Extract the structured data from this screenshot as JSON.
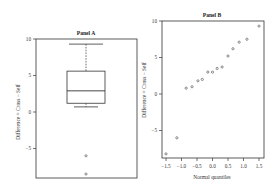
{
  "chart_data": [
    {
      "panel": "A",
      "type": "box",
      "title": "Panel A",
      "xlabel": "",
      "ylabel": "Difference = Cross − Self",
      "ylim": [
        -9.2,
        10
      ],
      "yticks": [
        10,
        5,
        0,
        -5
      ],
      "ytick_labels": [
        "10",
        "5",
        "0",
        "−5"
      ],
      "grid": false,
      "box": {
        "whisker_high": 9.3,
        "q3": 5.6,
        "median": 2.9,
        "q1": 1.2,
        "whisker_low": 0.7
      },
      "outliers": [
        -6.0,
        -8.5
      ]
    },
    {
      "panel": "B",
      "type": "scatter",
      "title": "Panel B",
      "xlabel": "Normal quantiles",
      "ylabel": "Difference = Cross − Self",
      "xlim": [
        -1.65,
        1.65
      ],
      "ylim": [
        -8.8,
        10
      ],
      "xticks": [
        -1.5,
        -1.0,
        -0.5,
        0.0,
        0.5,
        1.0,
        1.5
      ],
      "xtick_labels": [
        "−1.5",
        "−1.0",
        "−0.5",
        "0.0",
        "0.5",
        "1.0",
        "1.5"
      ],
      "yticks": [
        10,
        5,
        0,
        -5
      ],
      "ytick_labels": [
        "10",
        "5",
        "0",
        "−5"
      ],
      "grid": false,
      "points": [
        {
          "x": -1.5,
          "y": -8.2
        },
        {
          "x": -1.15,
          "y": -6.0
        },
        {
          "x": -0.85,
          "y": 0.8
        },
        {
          "x": -0.66,
          "y": 1.0
        },
        {
          "x": -0.47,
          "y": 1.8
        },
        {
          "x": -0.33,
          "y": 2.0
        },
        {
          "x": -0.15,
          "y": 3.0
        },
        {
          "x": 0.0,
          "y": 3.0
        },
        {
          "x": 0.15,
          "y": 3.5
        },
        {
          "x": 0.31,
          "y": 3.7
        },
        {
          "x": 0.5,
          "y": 5.2
        },
        {
          "x": 0.66,
          "y": 6.2
        },
        {
          "x": 0.86,
          "y": 7.1
        },
        {
          "x": 1.11,
          "y": 7.5
        },
        {
          "x": 1.5,
          "y": 9.3
        }
      ]
    }
  ]
}
